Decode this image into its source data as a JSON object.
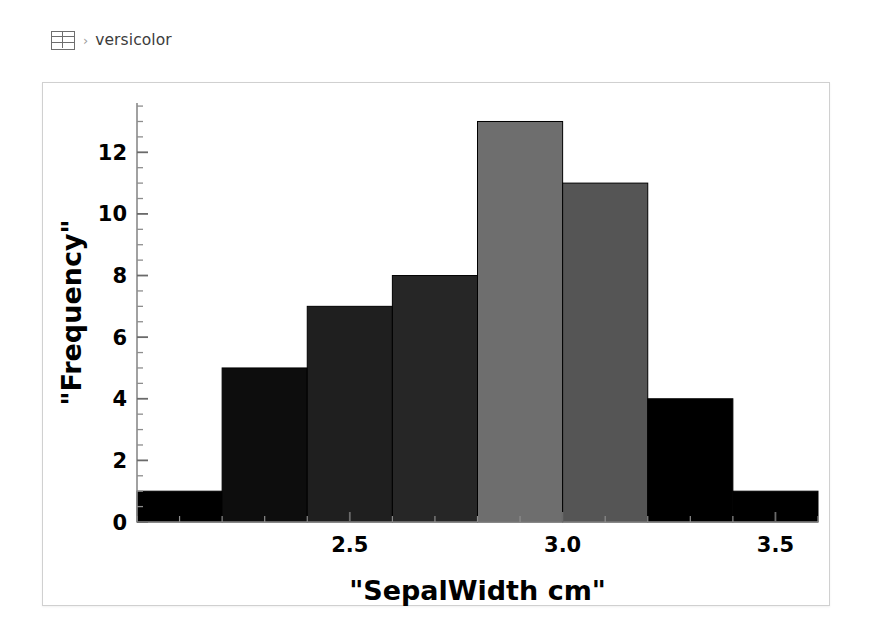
{
  "breadcrumb": {
    "icon": "table-grid-icon",
    "separator": "›",
    "label": "versicolor"
  },
  "chart_data": {
    "type": "bar",
    "title": "",
    "xlabel": "\"SepalWidth cm\"",
    "ylabel": "\"Frequency\"",
    "bin_width": 0.2,
    "bin_edges": [
      2.0,
      2.2,
      2.4,
      2.6,
      2.8,
      3.0,
      3.2,
      3.4,
      3.6
    ],
    "categories": [
      "2.0-2.2",
      "2.2-2.4",
      "2.4-2.6",
      "2.6-2.8",
      "2.8-3.0",
      "3.0-3.2",
      "3.2-3.4",
      "3.4-3.6"
    ],
    "values": [
      1,
      5,
      7,
      8,
      13,
      11,
      4,
      1
    ],
    "bar_colors": [
      "#000000",
      "#0d0d0d",
      "#1f1f1f",
      "#262626",
      "#6e6e6e",
      "#555555",
      "#000000",
      "#000000"
    ],
    "xlim": [
      2.0,
      3.6
    ],
    "ylim": [
      0,
      13.6
    ],
    "xticks": [
      2.5,
      3.0,
      3.5
    ],
    "xticklabels": [
      "2.5",
      "3.0",
      "3.5"
    ],
    "yticks": [
      0,
      2,
      4,
      6,
      8,
      10,
      12
    ],
    "yticklabels": [
      "0",
      "2",
      "4",
      "6",
      "8",
      "10",
      "12"
    ],
    "y_minor_step": 0.5,
    "grid": false,
    "legend": false
  }
}
